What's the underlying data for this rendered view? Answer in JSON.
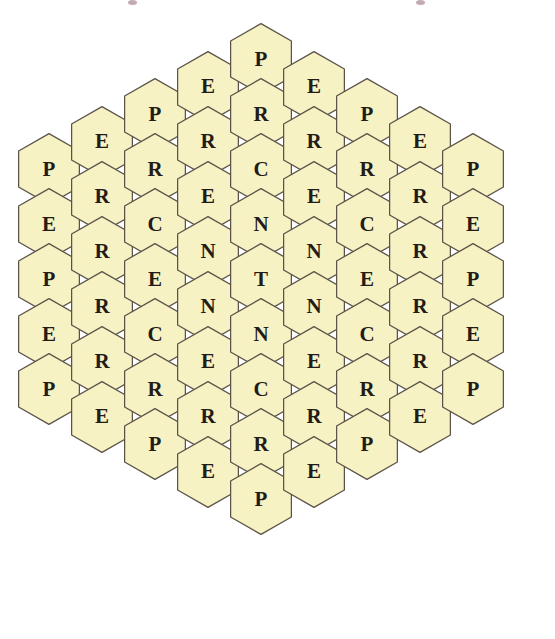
{
  "page": {
    "background_color": "#ffffff",
    "width": 555,
    "height": 639
  },
  "board": {
    "name": "hexagon-honeycomb-grid",
    "shape": "hexagon",
    "orientation": "pointy-top",
    "total_cells": 61,
    "columns_count": 9,
    "column_heights": [
      5,
      6,
      7,
      8,
      9,
      8,
      7,
      6,
      5
    ],
    "word": "PERCENT",
    "center_letter": "T",
    "symmetry": "horizontal and vertical mirror symmetry",
    "colors": {
      "hex_fill": "#F7F2C4",
      "hex_stroke": "#5b5348",
      "letter_color": "#231c16",
      "page_background": "#ffffff",
      "speck_color": "#b08a96"
    },
    "geometry": {
      "hex_width": 62,
      "hex_height": 72,
      "column_pitch_x": 53,
      "row_pitch_y": 55,
      "column_offset_y": 27.5,
      "first_column_center_x": 49,
      "grid_top_y": 23
    },
    "columns": [
      {
        "index": 0,
        "name": "column-1",
        "center_x": 49,
        "letters": [
          "P",
          "E",
          "P",
          "E",
          "P"
        ]
      },
      {
        "index": 1,
        "name": "column-2",
        "center_x": 102,
        "letters": [
          "E",
          "R",
          "R",
          "R",
          "R",
          "E"
        ]
      },
      {
        "index": 2,
        "name": "column-3",
        "center_x": 155,
        "letters": [
          "P",
          "R",
          "C",
          "E",
          "C",
          "R",
          "P"
        ]
      },
      {
        "index": 3,
        "name": "column-4",
        "center_x": 208,
        "letters": [
          "E",
          "R",
          "E",
          "N",
          "N",
          "E",
          "R",
          "E"
        ]
      },
      {
        "index": 4,
        "name": "column-5-center",
        "center_x": 261,
        "letters": [
          "P",
          "R",
          "C",
          "N",
          "T",
          "N",
          "C",
          "R",
          "P"
        ]
      },
      {
        "index": 5,
        "name": "column-6",
        "center_x": 314,
        "letters": [
          "E",
          "R",
          "E",
          "N",
          "N",
          "E",
          "R",
          "E"
        ]
      },
      {
        "index": 6,
        "name": "column-7",
        "center_x": 367,
        "letters": [
          "P",
          "R",
          "C",
          "E",
          "C",
          "R",
          "P"
        ]
      },
      {
        "index": 7,
        "name": "column-8",
        "center_x": 420,
        "letters": [
          "E",
          "R",
          "R",
          "R",
          "R",
          "E"
        ]
      },
      {
        "index": 8,
        "name": "column-9",
        "center_x": 473,
        "letters": [
          "P",
          "E",
          "P",
          "E",
          "P"
        ]
      }
    ],
    "specks": [
      {
        "name": "top-artifact-left",
        "x": 128,
        "y": 0
      },
      {
        "name": "top-artifact-right",
        "x": 416,
        "y": 0
      }
    ]
  }
}
